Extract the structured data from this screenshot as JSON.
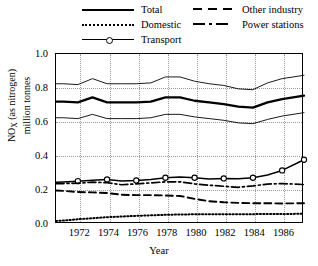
{
  "chart_data": {
    "type": "line",
    "title": "",
    "xlabel": "Year",
    "ylabel": "NOx (as nitrogen) million tonnes",
    "ylabel_line1": "NO",
    "ylabel_sub": "X",
    "ylabel_line1_rest": " (as nitrogen)",
    "ylabel_line2": "million tonnes",
    "xlim": [
      1970.5,
      1987.5
    ],
    "ylim": [
      0.0,
      1.0
    ],
    "grid": true,
    "legend_position": "top",
    "yticks": [
      "1.0",
      "0.8",
      "0.6",
      "0.4",
      "0.2",
      "0.0"
    ],
    "ytick_values": [
      1.0,
      0.8,
      0.6,
      0.4,
      0.2,
      0.0
    ],
    "xticks": [
      "1972",
      "1974",
      "1976",
      "1978",
      "1980",
      "1982",
      "1984",
      "1986"
    ],
    "xtick_values": [
      1972,
      1974,
      1976,
      1978,
      1980,
      1982,
      1984,
      1986
    ],
    "x": [
      1970.5,
      1971,
      1972,
      1973,
      1974,
      1975,
      1976,
      1977,
      1978,
      1979,
      1980,
      1981,
      1982,
      1983,
      1984,
      1985,
      1986,
      1987.5
    ],
    "series": [
      {
        "name": "Total",
        "style": "solid-thick",
        "values": [
          0.72,
          0.72,
          0.715,
          0.745,
          0.715,
          0.715,
          0.715,
          0.72,
          0.745,
          0.745,
          0.725,
          0.715,
          0.705,
          0.69,
          0.685,
          0.715,
          0.735,
          0.755
        ]
      },
      {
        "name": "Total upper bound",
        "style": "solid-thin",
        "values": [
          0.825,
          0.825,
          0.82,
          0.855,
          0.825,
          0.825,
          0.825,
          0.83,
          0.865,
          0.865,
          0.84,
          0.825,
          0.815,
          0.795,
          0.79,
          0.83,
          0.855,
          0.875
        ]
      },
      {
        "name": "Total lower bound",
        "style": "solid-thin",
        "values": [
          0.625,
          0.625,
          0.62,
          0.645,
          0.62,
          0.62,
          0.62,
          0.625,
          0.645,
          0.645,
          0.63,
          0.62,
          0.61,
          0.595,
          0.59,
          0.615,
          0.635,
          0.655
        ]
      },
      {
        "name": "Transport",
        "style": "solid-marker",
        "values": [
          0.245,
          0.247,
          0.252,
          0.258,
          0.262,
          0.253,
          0.256,
          0.262,
          0.272,
          0.276,
          0.272,
          0.265,
          0.268,
          0.266,
          0.272,
          0.288,
          0.315,
          0.378
        ]
      },
      {
        "name": "Power stations",
        "style": "dashdot",
        "values": [
          0.237,
          0.238,
          0.24,
          0.246,
          0.243,
          0.231,
          0.236,
          0.242,
          0.248,
          0.248,
          0.236,
          0.228,
          0.222,
          0.216,
          0.224,
          0.235,
          0.238,
          0.232
        ]
      },
      {
        "name": "Other industry",
        "style": "dashed",
        "values": [
          0.197,
          0.195,
          0.188,
          0.186,
          0.182,
          0.172,
          0.17,
          0.17,
          0.168,
          0.165,
          0.148,
          0.134,
          0.128,
          0.124,
          0.122,
          0.122,
          0.121,
          0.122
        ]
      },
      {
        "name": "Domestic",
        "style": "dotted",
        "values": [
          0.018,
          0.02,
          0.028,
          0.034,
          0.04,
          0.044,
          0.048,
          0.051,
          0.054,
          0.056,
          0.057,
          0.057,
          0.058,
          0.058,
          0.058,
          0.059,
          0.059,
          0.06
        ]
      }
    ],
    "legend": [
      {
        "label": "Total",
        "style": "solid-thick"
      },
      {
        "label": "Domestic",
        "style": "dotted"
      },
      {
        "label": "Transport",
        "style": "solid-marker"
      },
      {
        "label": "Other industry",
        "style": "dashed"
      },
      {
        "label": "Power stations",
        "style": "dashdot"
      }
    ],
    "colors": {
      "line": "#000000",
      "grid": "#9a9a9a",
      "background": "#ffffff"
    }
  }
}
